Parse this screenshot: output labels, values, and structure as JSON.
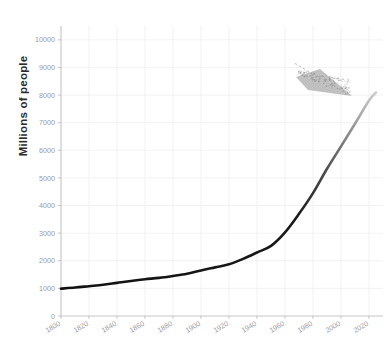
{
  "chart_data": {
    "type": "line",
    "title": "",
    "xlabel": "",
    "ylabel": "Millions of people",
    "xlim": [
      1800,
      2030
    ],
    "ylim": [
      0,
      10500
    ],
    "grid": true,
    "legend": "none",
    "x_ticks": [
      "1800",
      "1820",
      "1840",
      "1860",
      "1880",
      "1900",
      "1920",
      "1940",
      "1960",
      "1980",
      "2000",
      "2020"
    ],
    "y_ticks": [
      "0",
      "1000",
      "2000",
      "3000",
      "4000",
      "5000",
      "6000",
      "7000",
      "8000",
      "9000",
      "10000"
    ],
    "series": [
      {
        "name": "World population",
        "color_start": "#1a1a1a",
        "color_end": "#c9c9c9",
        "x": [
          1800,
          1810,
          1820,
          1830,
          1840,
          1850,
          1860,
          1870,
          1880,
          1890,
          1900,
          1910,
          1920,
          1930,
          1940,
          1950,
          1960,
          1970,
          1980,
          1990,
          2000,
          2010,
          2020,
          2025
        ],
        "values": [
          990,
          1030,
          1080,
          1130,
          1200,
          1270,
          1330,
          1380,
          1450,
          1530,
          1650,
          1760,
          1870,
          2070,
          2300,
          2540,
          3030,
          3700,
          4450,
          5330,
          6140,
          6960,
          7800,
          8100
        ]
      }
    ],
    "annotation": {
      "text": "",
      "readable": false,
      "description": "blurred-illegible-text-label",
      "leader_line": "dotted",
      "leader_from": [
        1967,
        9150
      ],
      "leader_to": [
        1993,
        8350
      ]
    }
  },
  "axis": {
    "y_axis_label": "Millions of people"
  }
}
